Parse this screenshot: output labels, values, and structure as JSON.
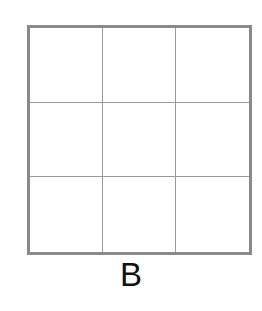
{
  "figure": {
    "label": "B",
    "grid": {
      "rows": 3,
      "columns": 3,
      "border_color": "#8a8a8a",
      "line_color": "#9a9a9a",
      "cells": [
        [
          "",
          "",
          ""
        ],
        [
          "",
          "",
          ""
        ],
        [
          "",
          "",
          ""
        ]
      ]
    }
  }
}
